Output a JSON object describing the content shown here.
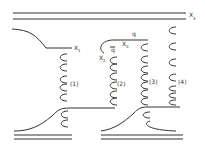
{
  "diagram": {
    "labels": {
      "x1": "X",
      "x1_sub": "1",
      "x2": "X",
      "x2_sub": "2",
      "x3": "X",
      "x3_sub": "3",
      "x4": "X",
      "x4_sub": "4",
      "q": "q",
      "q_bar": "q",
      "region1": "(1)",
      "region2": "(2)",
      "region3": "(3)",
      "region4": "(4)"
    },
    "colors": {
      "stroke": "#333333",
      "background": "#ffffff"
    }
  }
}
